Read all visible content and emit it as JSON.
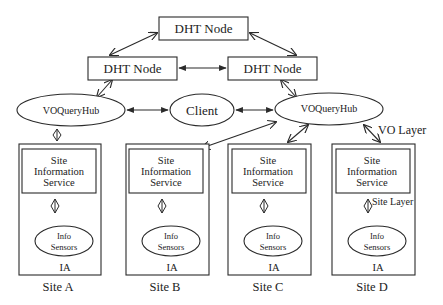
{
  "diagram": {
    "title": "",
    "colors": {
      "stroke": "#2a2a2a",
      "text": "#222222",
      "background": "#ffffff"
    },
    "dht_nodes": [
      {
        "id": "dht-top",
        "label": "DHT Node",
        "x": 159,
        "y": 17,
        "w": 89,
        "h": 23
      },
      {
        "id": "dht-left",
        "label": "DHT Node",
        "x": 88,
        "y": 57,
        "w": 89,
        "h": 23
      },
      {
        "id": "dht-right",
        "label": "DHT Node",
        "x": 228,
        "y": 57,
        "w": 89,
        "h": 23
      }
    ],
    "hubs": [
      {
        "id": "hub-left",
        "label": "VOQueryHub",
        "cx": 71,
        "cy": 110,
        "rx": 54,
        "ry": 16
      },
      {
        "id": "hub-right",
        "label": "VOQueryHub",
        "cx": 329,
        "cy": 109,
        "rx": 54,
        "ry": 16
      }
    ],
    "client": {
      "label": "Client",
      "cx": 202,
      "cy": 110,
      "rx": 32,
      "ry": 16
    },
    "layer_labels": {
      "vo_layer": "VO Layer",
      "site_layer": "Site Layer"
    },
    "sites": [
      {
        "id": "site-a",
        "name": "Site A",
        "x": 19,
        "service": [
          "Site",
          "Information",
          "Service"
        ],
        "sensors": [
          "Info",
          "Sensors"
        ],
        "agent": "IA"
      },
      {
        "id": "site-b",
        "name": "Site B",
        "x": 126,
        "service": [
          "Site",
          "Information",
          "Service"
        ],
        "sensors": [
          "Info",
          "Sensors"
        ],
        "agent": "IA"
      },
      {
        "id": "site-c",
        "name": "Site C",
        "x": 228,
        "service": [
          "Site",
          "Information",
          "Service"
        ],
        "sensors": [
          "Info",
          "Sensors"
        ],
        "agent": "IA"
      },
      {
        "id": "site-d",
        "name": "Site D",
        "x": 332,
        "service": [
          "Site",
          "Information",
          "Service"
        ],
        "sensors": [
          "Info",
          "Sensors"
        ],
        "agent": "IA"
      }
    ],
    "edges": [
      {
        "from": "dht-top",
        "to": "dht-left",
        "x1": 157,
        "y1": 33,
        "x2": 110,
        "y2": 55,
        "head": "open"
      },
      {
        "from": "dht-top",
        "to": "dht-right",
        "x1": 250,
        "y1": 33,
        "x2": 296,
        "y2": 55,
        "head": "open"
      },
      {
        "from": "dht-left",
        "to": "dht-right",
        "x1": 179,
        "y1": 68,
        "x2": 226,
        "y2": 68,
        "head": "solid"
      },
      {
        "from": "dht-left",
        "to": "hub-left",
        "x1": 112,
        "y1": 80,
        "x2": 97,
        "y2": 97,
        "head": "open"
      },
      {
        "from": "dht-right",
        "to": "hub-right",
        "x1": 281,
        "y1": 80,
        "x2": 296,
        "y2": 97,
        "head": "open"
      },
      {
        "from": "hub-left",
        "to": "client",
        "x1": 127,
        "y1": 110,
        "x2": 168,
        "y2": 110,
        "head": "solid"
      },
      {
        "from": "client",
        "to": "hub-right",
        "x1": 236,
        "y1": 110,
        "x2": 273,
        "y2": 110,
        "head": "solid"
      },
      {
        "from": "hub-right",
        "to": "site-b",
        "x1": 276,
        "y1": 122,
        "x2": 202,
        "y2": 148,
        "head": "open"
      },
      {
        "from": "hub-right",
        "to": "site-c",
        "x1": 308,
        "y1": 125,
        "x2": 288,
        "y2": 142,
        "head": "open"
      },
      {
        "from": "hub-right",
        "to": "site-d",
        "x1": 364,
        "y1": 125,
        "x2": 380,
        "y2": 142,
        "head": "open"
      }
    ]
  }
}
